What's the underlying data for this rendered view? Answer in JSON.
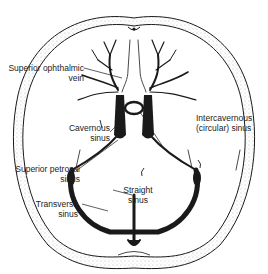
{
  "diagram": {
    "type": "anatomical illustration",
    "colors": {
      "ink": "#1a1a1a",
      "background": "#ffffff",
      "bone_stipple": "#888888"
    },
    "labels": [
      {
        "id": "superior-ophthalmic-vein",
        "line1": "Superior ophthalmic",
        "line2": "vein"
      },
      {
        "id": "cavernous-sinus",
        "line1": "Cavernous",
        "line2": "sinus"
      },
      {
        "id": "intercavernous-sinus",
        "line1": "Intercavernous",
        "line2": "(circular) sinus"
      },
      {
        "id": "superior-petrosal-sinus",
        "line1": "Superior petrosal",
        "line2": "sinus"
      },
      {
        "id": "straight-sinus",
        "line1": "Straight",
        "line2": "sinus"
      },
      {
        "id": "transverse-sinus",
        "line1": "Transverse",
        "line2": "sinus"
      }
    ]
  }
}
